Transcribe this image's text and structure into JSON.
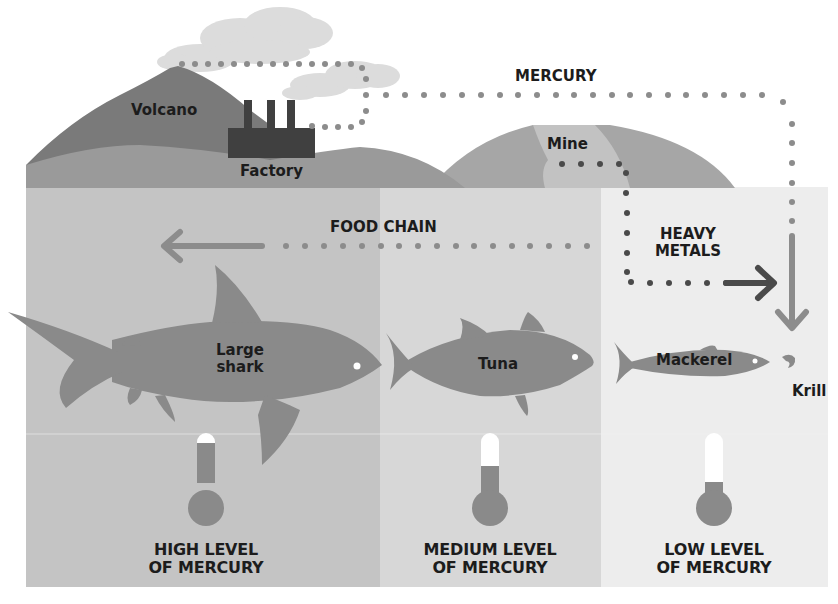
{
  "diagram": {
    "type": "infographic",
    "topic": "Mercury bioaccumulation in the ocean food chain"
  },
  "colors": {
    "land_dark": "#7a7a7a",
    "land_mid": "#9a9a9a",
    "land_light": "#b8b8b8",
    "factory": "#404040",
    "smoke": "#dcdcdc",
    "dots": "#8c8c8c",
    "ocean_high": "#c4c4c4",
    "ocean_medium": "#d7d7d7",
    "ocean_low": "#ededed",
    "fish": "#8a8a8a",
    "arrow_dark": "#4a4a4a",
    "text": "#1c1c1c"
  },
  "sources": {
    "volcano": "Volcano",
    "factory": "Factory",
    "mine": "Mine"
  },
  "flows": {
    "mercury": "MERCURY",
    "heavy_metals_line1": "HEAVY",
    "heavy_metals_line2": "METALS",
    "food_chain": "FOOD CHAIN"
  },
  "organisms": [
    {
      "id": "shark",
      "line1": "Large",
      "line2": "shark"
    },
    {
      "id": "tuna",
      "line1": "Tuna"
    },
    {
      "id": "mackerel",
      "line1": "Mackerel"
    },
    {
      "id": "krill",
      "line1": "Krill"
    }
  ],
  "levels": [
    {
      "id": "high",
      "line1": "HIGH LEVEL",
      "line2": "OF MERCURY",
      "fill_percent": 92
    },
    {
      "id": "medium",
      "line1": "MEDIUM LEVEL",
      "line2": "OF MERCURY",
      "fill_percent": 60
    },
    {
      "id": "low",
      "line1": "LOW LEVEL",
      "line2": "OF MERCURY",
      "fill_percent": 25
    }
  ]
}
